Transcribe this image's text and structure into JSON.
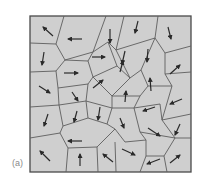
{
  "figure": {
    "panel_label": "(a)",
    "frame": {
      "x": 30,
      "y": 16,
      "width": 161,
      "height": 156
    },
    "colors": {
      "cell_fill": "#cfcfcf",
      "edge": "#5e5e5e",
      "frame": "#4a4a4a",
      "arrow": "#2a2a2a"
    },
    "edges": [
      [
        [
          64,
          16
        ],
        [
          56,
          44
        ]
      ],
      [
        [
          30,
          43
        ],
        [
          56,
          44
        ]
      ],
      [
        [
          56,
          44
        ],
        [
          65,
          60
        ]
      ],
      [
        [
          106,
          16
        ],
        [
          93,
          52
        ]
      ],
      [
        [
          124,
          16
        ],
        [
          116,
          50
        ]
      ],
      [
        [
          158,
          16
        ],
        [
          155,
          38
        ]
      ],
      [
        [
          65,
          60
        ],
        [
          93,
          52
        ]
      ],
      [
        [
          93,
          52
        ],
        [
          108,
          42
        ]
      ],
      [
        [
          108,
          42
        ],
        [
          116,
          50
        ]
      ],
      [
        [
          116,
          50
        ],
        [
          155,
          38
        ]
      ],
      [
        [
          155,
          38
        ],
        [
          165,
          53
        ]
      ],
      [
        [
          165,
          53
        ],
        [
          191,
          46
        ]
      ],
      [
        [
          30,
          72
        ],
        [
          56,
          71
        ]
      ],
      [
        [
          56,
          71
        ],
        [
          65,
          60
        ]
      ],
      [
        [
          56,
          71
        ],
        [
          58,
          88
        ]
      ],
      [
        [
          65,
          60
        ],
        [
          88,
          61
        ]
      ],
      [
        [
          88,
          61
        ],
        [
          93,
          52
        ]
      ],
      [
        [
          88,
          61
        ],
        [
          93,
          77
        ]
      ],
      [
        [
          108,
          42
        ],
        [
          117,
          66
        ]
      ],
      [
        [
          116,
          50
        ],
        [
          130,
          78
        ]
      ],
      [
        [
          117,
          66
        ],
        [
          93,
          77
        ]
      ],
      [
        [
          117,
          66
        ],
        [
          130,
          78
        ]
      ],
      [
        [
          130,
          78
        ],
        [
          141,
          70
        ]
      ],
      [
        [
          141,
          70
        ],
        [
          155,
          38
        ]
      ],
      [
        [
          141,
          70
        ],
        [
          148,
          86
        ]
      ],
      [
        [
          165,
          53
        ],
        [
          165,
          74
        ]
      ],
      [
        [
          165,
          74
        ],
        [
          191,
          72
        ]
      ],
      [
        [
          165,
          74
        ],
        [
          172,
          86
        ]
      ],
      [
        [
          148,
          86
        ],
        [
          172,
          86
        ]
      ],
      [
        [
          58,
          88
        ],
        [
          88,
          84
        ]
      ],
      [
        [
          88,
          84
        ],
        [
          93,
          77
        ]
      ],
      [
        [
          88,
          84
        ],
        [
          86,
          101
        ]
      ],
      [
        [
          93,
          77
        ],
        [
          112,
          96
        ]
      ],
      [
        [
          130,
          78
        ],
        [
          112,
          96
        ]
      ],
      [
        [
          112,
          96
        ],
        [
          140,
          96
        ]
      ],
      [
        [
          140,
          96
        ],
        [
          148,
          86
        ]
      ],
      [
        [
          140,
          96
        ],
        [
          134,
          108
        ]
      ],
      [
        [
          30,
          107
        ],
        [
          59,
          105
        ]
      ],
      [
        [
          58,
          88
        ],
        [
          59,
          105
        ]
      ],
      [
        [
          59,
          105
        ],
        [
          86,
          101
        ]
      ],
      [
        [
          86,
          101
        ],
        [
          112,
          108
        ]
      ],
      [
        [
          112,
          96
        ],
        [
          112,
          108
        ]
      ],
      [
        [
          112,
          108
        ],
        [
          134,
          108
        ]
      ],
      [
        [
          134,
          108
        ],
        [
          160,
          104
        ]
      ],
      [
        [
          172,
          86
        ],
        [
          162,
          120
        ]
      ],
      [
        [
          160,
          104
        ],
        [
          162,
          120
        ]
      ],
      [
        [
          162,
          120
        ],
        [
          191,
          114
        ]
      ],
      [
        [
          134,
          108
        ],
        [
          140,
          132
        ]
      ],
      [
        [
          59,
          105
        ],
        [
          63,
          126
        ]
      ],
      [
        [
          63,
          126
        ],
        [
          88,
          118
        ]
      ],
      [
        [
          86,
          101
        ],
        [
          88,
          118
        ]
      ],
      [
        [
          88,
          118
        ],
        [
          107,
          124
        ]
      ],
      [
        [
          107,
          124
        ],
        [
          112,
          108
        ]
      ],
      [
        [
          107,
          124
        ],
        [
          115,
          129
        ]
      ],
      [
        [
          115,
          129
        ],
        [
          125,
          142
        ]
      ],
      [
        [
          125,
          142
        ],
        [
          146,
          140
        ]
      ],
      [
        [
          140,
          132
        ],
        [
          146,
          140
        ]
      ],
      [
        [
          140,
          132
        ],
        [
          175,
          138
        ]
      ],
      [
        [
          162,
          120
        ],
        [
          175,
          138
        ]
      ],
      [
        [
          175,
          138
        ],
        [
          191,
          138
        ]
      ],
      [
        [
          30,
          138
        ],
        [
          60,
          133
        ]
      ],
      [
        [
          60,
          133
        ],
        [
          63,
          126
        ]
      ],
      [
        [
          60,
          133
        ],
        [
          68,
          148
        ]
      ],
      [
        [
          68,
          148
        ],
        [
          97,
          147
        ]
      ],
      [
        [
          97,
          147
        ],
        [
          115,
          129
        ]
      ],
      [
        [
          97,
          147
        ],
        [
          98,
          172
        ]
      ],
      [
        [
          68,
          148
        ],
        [
          66,
          172
        ]
      ],
      [
        [
          115,
          142
        ],
        [
          116,
          172
        ]
      ],
      [
        [
          146,
          140
        ],
        [
          146,
          156
        ]
      ],
      [
        [
          146,
          156
        ],
        [
          164,
          156
        ]
      ],
      [
        [
          164,
          156
        ],
        [
          175,
          138
        ]
      ],
      [
        [
          146,
          156
        ],
        [
          140,
          172
        ]
      ],
      [
        [
          164,
          156
        ],
        [
          167,
          172
        ]
      ]
    ],
    "arrows": [
      {
        "x1": 53,
        "y1": 36,
        "x2": 43,
        "y2": 27
      },
      {
        "x1": 82,
        "y1": 39,
        "x2": 68,
        "y2": 39
      },
      {
        "x1": 110,
        "y1": 29,
        "x2": 110,
        "y2": 43
      },
      {
        "x1": 138,
        "y1": 21,
        "x2": 135,
        "y2": 33
      },
      {
        "x1": 168,
        "y1": 27,
        "x2": 171,
        "y2": 39
      },
      {
        "x1": 44,
        "y1": 52,
        "x2": 42,
        "y2": 65
      },
      {
        "x1": 92,
        "y1": 57,
        "x2": 105,
        "y2": 57
      },
      {
        "x1": 125,
        "y1": 51,
        "x2": 122,
        "y2": 64
      },
      {
        "x1": 148,
        "y1": 49,
        "x2": 147,
        "y2": 62
      },
      {
        "x1": 170,
        "y1": 74,
        "x2": 180,
        "y2": 65
      },
      {
        "x1": 64,
        "y1": 73,
        "x2": 78,
        "y2": 73
      },
      {
        "x1": 93,
        "y1": 88,
        "x2": 103,
        "y2": 80
      },
      {
        "x1": 120,
        "y1": 72,
        "x2": 123,
        "y2": 61
      },
      {
        "x1": 151,
        "y1": 91,
        "x2": 150,
        "y2": 78
      },
      {
        "x1": 39,
        "y1": 86,
        "x2": 50,
        "y2": 93
      },
      {
        "x1": 72,
        "y1": 92,
        "x2": 78,
        "y2": 101
      },
      {
        "x1": 125,
        "y1": 102,
        "x2": 126,
        "y2": 91
      },
      {
        "x1": 182,
        "y1": 99,
        "x2": 170,
        "y2": 104
      },
      {
        "x1": 155,
        "y1": 107,
        "x2": 143,
        "y2": 111
      },
      {
        "x1": 48,
        "y1": 114,
        "x2": 44,
        "y2": 126
      },
      {
        "x1": 77,
        "y1": 111,
        "x2": 74,
        "y2": 122
      },
      {
        "x1": 100,
        "y1": 107,
        "x2": 98,
        "y2": 120
      },
      {
        "x1": 120,
        "y1": 118,
        "x2": 124,
        "y2": 128
      },
      {
        "x1": 180,
        "y1": 124,
        "x2": 175,
        "y2": 135
      },
      {
        "x1": 148,
        "y1": 128,
        "x2": 160,
        "y2": 136
      },
      {
        "x1": 82,
        "y1": 141,
        "x2": 68,
        "y2": 141
      },
      {
        "x1": 50,
        "y1": 161,
        "x2": 40,
        "y2": 151
      },
      {
        "x1": 80,
        "y1": 166,
        "x2": 80,
        "y2": 154
      },
      {
        "x1": 113,
        "y1": 162,
        "x2": 103,
        "y2": 154
      },
      {
        "x1": 122,
        "y1": 149,
        "x2": 135,
        "y2": 155
      },
      {
        "x1": 160,
        "y1": 159,
        "x2": 147,
        "y2": 164
      },
      {
        "x1": 170,
        "y1": 163,
        "x2": 180,
        "y2": 155
      }
    ]
  }
}
